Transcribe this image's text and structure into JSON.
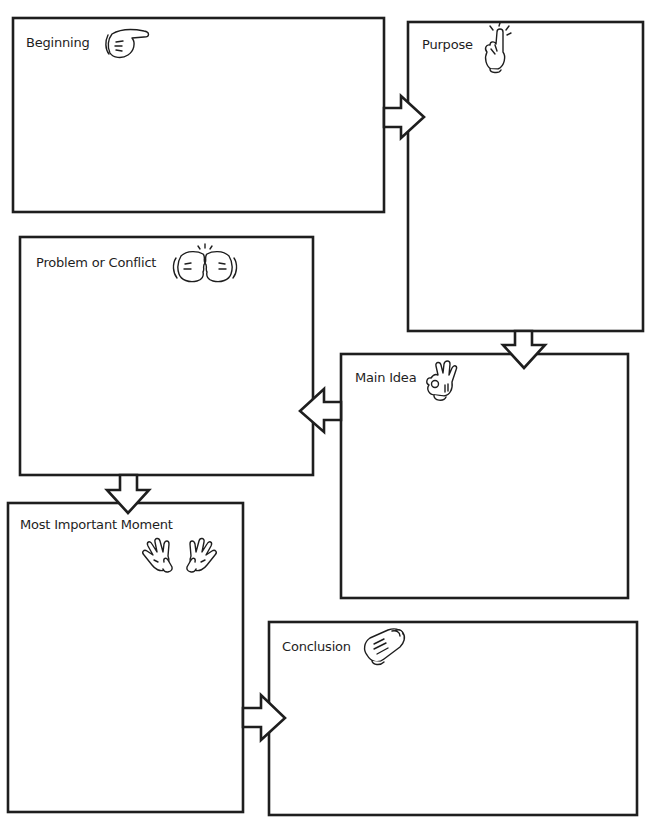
{
  "organizer": {
    "boxes": [
      {
        "id": "beginning",
        "label": "Beginning",
        "icon": "pointing-hand-icon"
      },
      {
        "id": "purpose",
        "label": "Purpose",
        "icon": "raised-finger-icon"
      },
      {
        "id": "problem",
        "label": "Problem or Conflict",
        "icon": "bumping-fists-icon"
      },
      {
        "id": "main-idea",
        "label": "Main Idea",
        "icon": "ok-hand-icon"
      },
      {
        "id": "most-important",
        "label": "Most Important Moment",
        "icon": "open-hands-icon"
      },
      {
        "id": "conclusion",
        "label": "Conclusion",
        "icon": "clapping-hands-icon"
      }
    ],
    "flow": [
      {
        "from": "Beginning",
        "to": "Purpose",
        "direction": "right"
      },
      {
        "from": "Purpose",
        "to": "Main Idea",
        "direction": "down"
      },
      {
        "from": "Main Idea",
        "to": "Problem or Conflict",
        "direction": "left"
      },
      {
        "from": "Problem or Conflict",
        "to": "Most Important Moment",
        "direction": "down"
      },
      {
        "from": "Most Important Moment",
        "to": "Conclusion",
        "direction": "right"
      }
    ],
    "colors": {
      "line": "#1e1e1e",
      "background": "#ffffff"
    }
  }
}
